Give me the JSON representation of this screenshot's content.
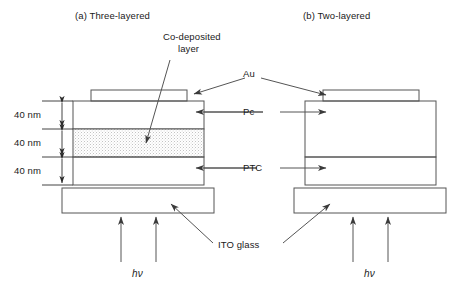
{
  "figure": {
    "panels": [
      {
        "id": "a",
        "label": "(a) Three-layered",
        "layer_count": 3
      },
      {
        "id": "b",
        "label": "(b) Two-layered",
        "layer_count": 2
      }
    ],
    "annotations": {
      "codeposited_line1": "Co-deposited",
      "codeposited_line2": "layer",
      "au": "Au",
      "pc": "Pc",
      "ptc": "PTC",
      "ito": "ITO glass"
    },
    "dimensions": [
      {
        "value": "40 nm",
        "layer": "Pc"
      },
      {
        "value": "40 nm",
        "layer": "Co-deposited"
      },
      {
        "value": "40 nm",
        "layer": "PTC"
      }
    ],
    "illumination": {
      "left_label": "hv",
      "right_label": "hv",
      "h": "h",
      "nu": "ν",
      "arrow_count_per_panel": 2
    },
    "colors": {
      "stroke": "#555555",
      "text": "#1a1a1a",
      "background": "#ffffff",
      "stipple": "#8a8a8a"
    }
  }
}
